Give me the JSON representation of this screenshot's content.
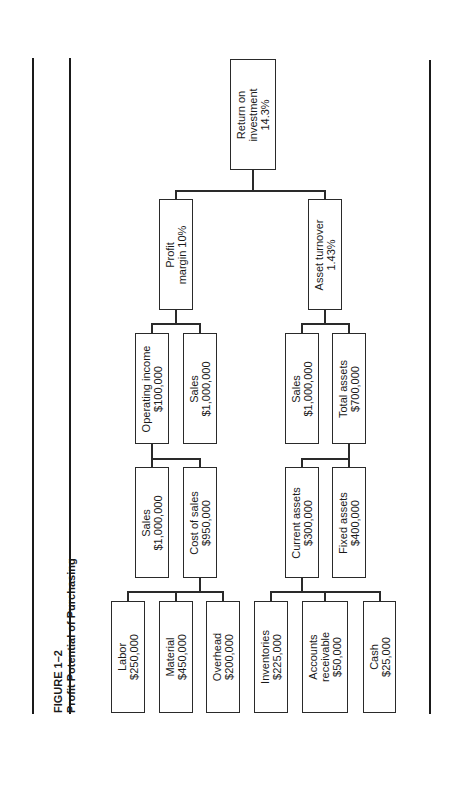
{
  "figure": {
    "number": "FIGURE 1–2",
    "title": "Profit Potential of Purchasing"
  },
  "nodes": {
    "roi": {
      "line1": "Return on",
      "line2": "investment",
      "line3": "14.3%"
    },
    "profit_margin": {
      "line1": "Profit",
      "line2": "margin 10%"
    },
    "asset_turnover": {
      "line1": "Asset turnover",
      "line2": "1.43%"
    },
    "operating_income": {
      "line1": "Operating income",
      "line2": "$100,000"
    },
    "sales_pm": {
      "line1": "Sales",
      "line2": "$1,000,000"
    },
    "sales_at": {
      "line1": "Sales",
      "line2": "$1,000,000"
    },
    "total_assets": {
      "line1": "Total assets",
      "line2": "$700,000"
    },
    "sales_oi": {
      "line1": "Sales",
      "line2": "$1,000,000"
    },
    "cost_of_sales": {
      "line1": "Cost of sales",
      "line2": "$950,000"
    },
    "current_assets": {
      "line1": "Current assets",
      "line2": "$300,000"
    },
    "fixed_assets": {
      "line1": "Fixed assets",
      "line2": "$400,000"
    },
    "labor": {
      "line1": "Labor",
      "line2": "$250,000"
    },
    "material": {
      "line1": "Material",
      "line2": "$450,000"
    },
    "overhead": {
      "line1": "Overhead",
      "line2": "$200,000"
    },
    "inventories": {
      "line1": "Inventories",
      "line2": "$225,000"
    },
    "accounts_receivable": {
      "line1": "Accounts",
      "line2": "receivable",
      "line3": "$50,000"
    },
    "cash": {
      "line1": "Cash",
      "line2": "$25,000"
    }
  }
}
